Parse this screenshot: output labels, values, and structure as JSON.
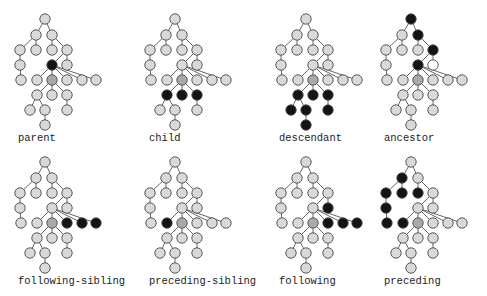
{
  "colors": {
    "node_default": "#d9d9d9",
    "node_context": "#a9a9a9",
    "node_selected": "#141414",
    "node_empty": "#ffffff",
    "stroke": "#4a4a4a",
    "edge": "#555555"
  },
  "tree": {
    "nodes": [
      {
        "id": 0,
        "x": 45,
        "y": 19
      },
      {
        "id": 1,
        "x": 36,
        "y": 35
      },
      {
        "id": 2,
        "x": 52,
        "y": 35
      },
      {
        "id": 3,
        "x": 20,
        "y": 50
      },
      {
        "id": 4,
        "x": 36,
        "y": 50
      },
      {
        "id": 5,
        "x": 52,
        "y": 50
      },
      {
        "id": 6,
        "x": 67,
        "y": 50
      },
      {
        "id": 7,
        "x": 20,
        "y": 65
      },
      {
        "id": 8,
        "x": 52,
        "y": 65
      },
      {
        "id": 9,
        "x": 67,
        "y": 65
      },
      {
        "id": 10,
        "x": 21,
        "y": 80
      },
      {
        "id": 11,
        "x": 37,
        "y": 80
      },
      {
        "id": 12,
        "x": 52,
        "y": 80
      },
      {
        "id": 13,
        "x": 67,
        "y": 80
      },
      {
        "id": 14,
        "x": 82,
        "y": 80
      },
      {
        "id": 15,
        "x": 96,
        "y": 80
      },
      {
        "id": 16,
        "x": 37,
        "y": 95
      },
      {
        "id": 17,
        "x": 52,
        "y": 95
      },
      {
        "id": 18,
        "x": 67,
        "y": 95
      },
      {
        "id": 19,
        "x": 30,
        "y": 110
      },
      {
        "id": 20,
        "x": 45,
        "y": 110
      },
      {
        "id": 21,
        "x": 67,
        "y": 110
      },
      {
        "id": 22,
        "x": 45,
        "y": 125
      }
    ],
    "edges": [
      [
        0,
        1
      ],
      [
        0,
        2
      ],
      [
        1,
        3
      ],
      [
        1,
        4
      ],
      [
        2,
        5
      ],
      [
        2,
        6
      ],
      [
        3,
        7
      ],
      [
        7,
        10
      ],
      [
        6,
        8
      ],
      [
        6,
        9
      ],
      [
        8,
        11
      ],
      [
        8,
        12
      ],
      [
        8,
        13
      ],
      [
        8,
        14
      ],
      [
        8,
        15
      ],
      [
        12,
        16
      ],
      [
        12,
        17
      ],
      [
        12,
        18
      ],
      [
        16,
        19
      ],
      [
        16,
        20
      ],
      [
        20,
        22
      ],
      [
        18,
        21
      ]
    ],
    "context_node": 12
  },
  "panels": [
    {
      "label": "parent",
      "dx": 0,
      "dy": 0,
      "label_x": 18,
      "label_y": 132,
      "selected": [
        8
      ],
      "empty": []
    },
    {
      "label": "child",
      "dx": 130,
      "dy": 0,
      "label_x": 149,
      "label_y": 132,
      "selected": [
        16,
        17,
        18
      ],
      "empty": []
    },
    {
      "label": "descendant",
      "dx": 261,
      "dy": 0,
      "label_x": 279,
      "label_y": 132,
      "selected": [
        16,
        17,
        18,
        19,
        20,
        21,
        22
      ],
      "empty": []
    },
    {
      "label": "ancestor",
      "dx": 366,
      "dy": 0,
      "label_x": 384,
      "label_y": 132,
      "selected": [
        0,
        2,
        6,
        8
      ],
      "empty": [
        9
      ]
    },
    {
      "label": "following-sibling",
      "dx": 0,
      "dy": 143,
      "label_x": 18,
      "label_y": 275,
      "selected": [
        13,
        14,
        15
      ],
      "empty": []
    },
    {
      "label": "preceding-sibling",
      "dx": 130,
      "dy": 143,
      "label_x": 149,
      "label_y": 275,
      "selected": [
        11
      ],
      "empty": []
    },
    {
      "label": "following",
      "dx": 261,
      "dy": 143,
      "label_x": 279,
      "label_y": 275,
      "selected": [
        9,
        13,
        14,
        15
      ],
      "empty": []
    },
    {
      "label": "preceding",
      "dx": 366,
      "dy": 143,
      "label_x": 384,
      "label_y": 275,
      "selected": [
        1,
        3,
        4,
        5,
        7,
        10,
        11
      ],
      "empty": []
    }
  ]
}
